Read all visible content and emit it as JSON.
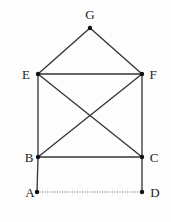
{
  "diagram": {
    "type": "geometric figure",
    "points": [
      {
        "id": "G",
        "x": 90,
        "y": 28,
        "lx": 90,
        "ly": 14
      },
      {
        "id": "E",
        "x": 38,
        "y": 74,
        "lx": 26,
        "ly": 74
      },
      {
        "id": "F",
        "x": 142,
        "y": 74,
        "lx": 153,
        "ly": 74
      },
      {
        "id": "B",
        "x": 38,
        "y": 157,
        "lx": 29,
        "ly": 157
      },
      {
        "id": "C",
        "x": 142,
        "y": 157,
        "lx": 154,
        "ly": 157
      },
      {
        "id": "A",
        "x": 37,
        "y": 192,
        "lx": 30,
        "ly": 192
      },
      {
        "id": "D",
        "x": 142,
        "y": 192,
        "lx": 155,
        "ly": 192
      }
    ],
    "segments": [
      {
        "from": "G",
        "to": "E",
        "style": "solid"
      },
      {
        "from": "G",
        "to": "F",
        "style": "solid"
      },
      {
        "from": "E",
        "to": "F",
        "style": "solid"
      },
      {
        "from": "E",
        "to": "B",
        "style": "solid"
      },
      {
        "from": "F",
        "to": "C",
        "style": "solid"
      },
      {
        "from": "E",
        "to": "C",
        "style": "solid"
      },
      {
        "from": "F",
        "to": "B",
        "style": "solid"
      },
      {
        "from": "B",
        "to": "C",
        "style": "solid"
      },
      {
        "from": "B",
        "to": "A",
        "style": "solid"
      },
      {
        "from": "C",
        "to": "D",
        "style": "solid"
      },
      {
        "from": "A",
        "to": "D",
        "style": "dotted"
      }
    ],
    "colors": {
      "line": "#333333",
      "point": "#111111",
      "background": "#fdfdfd"
    }
  }
}
